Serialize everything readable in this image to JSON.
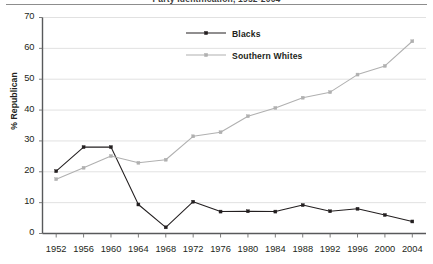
{
  "figure": {
    "title_clipped": "Party Identification, 1952-2004",
    "ylabel": "% Republican",
    "background": "#ffffff",
    "rule_color": "#8d8d8d"
  },
  "legend": {
    "position": "inside-top-center",
    "entries": [
      {
        "label": "Blacks",
        "color": "#231f20",
        "marker": "square"
      },
      {
        "label": "Southern Whites",
        "color": "#b0b0b0",
        "marker": "square"
      }
    ]
  },
  "axes": {
    "y_ticks": [
      "0",
      "10",
      "20",
      "30",
      "40",
      "50",
      "60",
      "70"
    ],
    "x_ticks": [
      "1952",
      "1956",
      "1960",
      "1964",
      "1968",
      "1972",
      "1976",
      "1980",
      "1984",
      "1988",
      "1992",
      "1996",
      "2000",
      "2004"
    ]
  },
  "chart_data": {
    "type": "line",
    "title": "Party Identification, 1952-2004",
    "xlabel": "",
    "ylabel": "% Republican",
    "ylim": [
      0,
      70
    ],
    "ytick_step": 10,
    "grid": true,
    "legend_position": "upper center",
    "x": [
      1952,
      1956,
      1960,
      1964,
      1968,
      1972,
      1976,
      1980,
      1984,
      1988,
      1992,
      1996,
      2000,
      2004
    ],
    "categories": [
      "1952",
      "1956",
      "1960",
      "1964",
      "1968",
      "1972",
      "1976",
      "1980",
      "1984",
      "1988",
      "1992",
      "1996",
      "2000",
      "2004"
    ],
    "series": [
      {
        "name": "Blacks",
        "color": "#231f20",
        "values": [
          20.2,
          28.0,
          28.0,
          9.4,
          2.0,
          10.3,
          7.1,
          7.2,
          7.1,
          9.2,
          7.2,
          8.0,
          6.0,
          3.9
        ]
      },
      {
        "name": "Southern Whites",
        "color": "#b0b0b0",
        "values": [
          17.6,
          21.3,
          25.1,
          22.9,
          23.9,
          31.5,
          32.8,
          38.0,
          40.7,
          44.0,
          45.8,
          51.5,
          54.3,
          62.3
        ]
      }
    ]
  }
}
